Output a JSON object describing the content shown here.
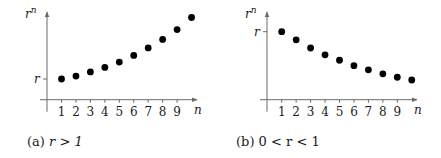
{
  "chart_data": [
    {
      "type": "scatter",
      "caption": "(a) r > 1",
      "caption_prefix": "(a)",
      "caption_math": "r > 1",
      "xlabel": "n",
      "ylabel": "r",
      "ylabel_sup": "n",
      "ytick_label": "r",
      "ytick_value": 1,
      "x_ticks": [
        "1",
        "2",
        "3",
        "4",
        "5",
        "6",
        "7",
        "8",
        "9"
      ],
      "x": [
        1,
        2,
        3,
        4,
        5,
        6,
        7,
        8,
        9,
        10
      ],
      "y": [
        1,
        1.14,
        1.34,
        1.56,
        1.82,
        2.14,
        2.5,
        2.91,
        3.39,
        3.97
      ],
      "ylim": [
        0,
        4.1
      ],
      "xlim": [
        0,
        10.3
      ],
      "grid": false
    },
    {
      "type": "scatter",
      "caption": "(b) 0 < r < 1",
      "caption_prefix": "(b)",
      "caption_math": "0 < r < 1",
      "xlabel": "n",
      "ylabel": "r",
      "ylabel_sup": "n",
      "ytick_label": "r",
      "ytick_value": 1,
      "x_ticks": [
        "1",
        "2",
        "3",
        "4",
        "5",
        "6",
        "7",
        "8",
        "9"
      ],
      "x": [
        1,
        2,
        3,
        4,
        5,
        6,
        7,
        8,
        9,
        10
      ],
      "y": [
        1,
        0.88,
        0.76,
        0.66,
        0.58,
        0.5,
        0.44,
        0.38,
        0.33,
        0.29
      ],
      "ylim": [
        0,
        1.24
      ],
      "xlim": [
        0,
        10.3
      ],
      "grid": false
    }
  ],
  "colors": {
    "dots": "#000000",
    "axes": "#6a6a6a"
  }
}
